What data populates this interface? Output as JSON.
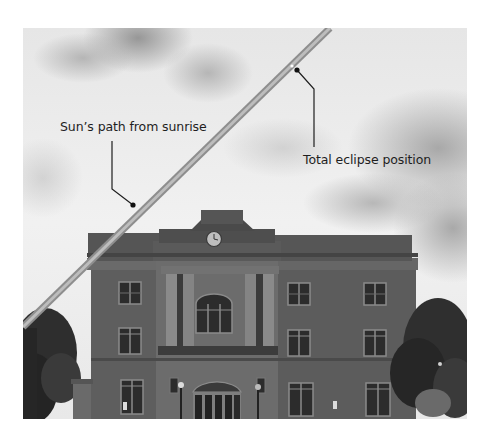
{
  "figure": {
    "type": "annotated-photograph",
    "palette": {
      "sky_light": "#f2f2f2",
      "cloud_dark": "#9a9a9a",
      "brick": "#5c5c5c",
      "brick_dark": "#3e3e3e",
      "stone": "#7a7a7a",
      "window": "#2a2a2a",
      "tree": "#2b2b2b",
      "sun_path": "#a0a0a0",
      "annotation": "#1e1e1e"
    }
  },
  "annotations": {
    "sun_path": {
      "label": "Sun’s path from sunrise",
      "line": {
        "x1": 330,
        "y1": 28,
        "x2": 23,
        "y2": 327
      }
    },
    "eclipse": {
      "label": "Total eclipse position"
    }
  },
  "icons": {
    "clock": "clock-face"
  }
}
